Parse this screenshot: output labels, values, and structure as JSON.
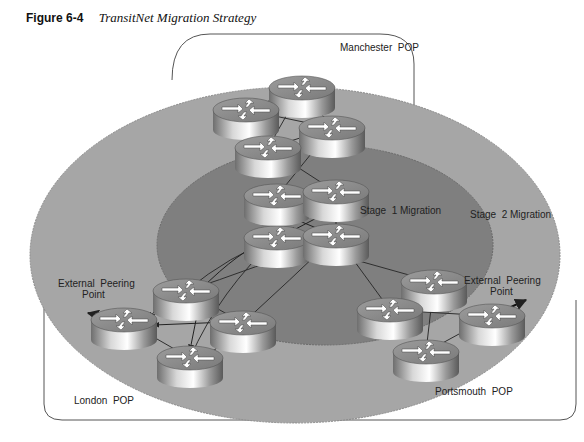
{
  "figure": {
    "number": "Figure 6-4",
    "title": "TransitNet Migration Strategy"
  },
  "regions": {
    "manchester": "Manchester  POP",
    "london": "London  POP",
    "portsmouth": "Portsmouth  POP",
    "stage1": "Stage  1 Migration",
    "stage2": "Stage  2 Migration"
  },
  "peering": {
    "left_line1": "External  Peering",
    "left_line2": "Point",
    "right_line1": "External  Peering",
    "right_line2": "Point"
  },
  "colors": {
    "stage2_fill": "#a6a6a6",
    "stage1_fill": "#7f7f7f",
    "pop_border": "#555555",
    "link": "#333333"
  },
  "routers": [
    {
      "id": "m1",
      "x": 302,
      "y": 88
    },
    {
      "id": "m2",
      "x": 246,
      "y": 110
    },
    {
      "id": "m3",
      "x": 332,
      "y": 128
    },
    {
      "id": "m4",
      "x": 268,
      "y": 148
    },
    {
      "id": "c1",
      "x": 277,
      "y": 196
    },
    {
      "id": "c2",
      "x": 336,
      "y": 192
    },
    {
      "id": "c3",
      "x": 277,
      "y": 238
    },
    {
      "id": "c4",
      "x": 336,
      "y": 236
    },
    {
      "id": "l1",
      "x": 186,
      "y": 291
    },
    {
      "id": "l2",
      "x": 124,
      "y": 320
    },
    {
      "id": "l3",
      "x": 243,
      "y": 323
    },
    {
      "id": "l4",
      "x": 190,
      "y": 358
    },
    {
      "id": "p1",
      "x": 434,
      "y": 282
    },
    {
      "id": "p2",
      "x": 390,
      "y": 310
    },
    {
      "id": "p3",
      "x": 492,
      "y": 316
    },
    {
      "id": "p4",
      "x": 426,
      "y": 352
    }
  ]
}
